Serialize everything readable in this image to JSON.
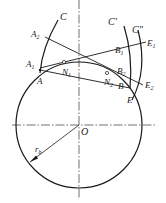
{
  "diagram": {
    "type": "involute-geometry",
    "colors": {
      "stroke": "#1a1a1a",
      "background": "#ffffff"
    },
    "base_circle": {
      "label": "O",
      "radius_label": "r",
      "radius_subscript": "b"
    },
    "curves": [
      {
        "id": "C",
        "label": "C"
      },
      {
        "id": "C1",
        "label": "C′"
      },
      {
        "id": "C2",
        "label": "C″"
      }
    ],
    "points": {
      "A": "A",
      "A1": "A",
      "A1_sub": "1",
      "A2": "A",
      "A2_sub": "2",
      "N1": "N",
      "N1_sub": "1",
      "N2": "N",
      "N2_sub": "2",
      "B": "B",
      "B1": "B",
      "B1_sub": "1",
      "B2": "B",
      "B2_sub": "2",
      "E": "E",
      "E1": "E",
      "E1_sub": "1",
      "E2": "E",
      "E2_sub": "2"
    }
  }
}
